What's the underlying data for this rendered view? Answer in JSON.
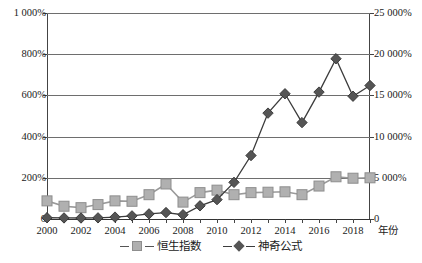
{
  "chart_data": {
    "type": "line",
    "title": "",
    "xlabel": "年份",
    "ylabel": "",
    "x": [
      2000,
      2001,
      2002,
      2003,
      2004,
      2005,
      2006,
      2007,
      2008,
      2009,
      2010,
      2011,
      2012,
      2013,
      2014,
      2015,
      2016,
      2017,
      2018,
      2019
    ],
    "categories": [
      "2000",
      "2001",
      "2002",
      "2003",
      "2004",
      "2005",
      "2006",
      "2007",
      "2008",
      "2009",
      "2010",
      "2011",
      "2012",
      "2013",
      "2014",
      "2015",
      "2016",
      "2017",
      "2018",
      "2019"
    ],
    "grid": true,
    "legend_position": "bottom",
    "axes": {
      "left": {
        "label": "",
        "ylim": [
          0,
          1000
        ],
        "unit": "%",
        "ticks": [
          0,
          200,
          400,
          600,
          800,
          1000
        ],
        "tick_labels": [
          "0",
          "200%",
          "400%",
          "600%",
          "800%",
          "1 000%"
        ]
      },
      "right": {
        "label": "",
        "ylim": [
          0,
          25000
        ],
        "unit": "%",
        "ticks": [
          0,
          5000,
          10000,
          15000,
          20000,
          25000
        ],
        "tick_labels": [
          "0",
          "5 000%",
          "10 000%",
          "15 000%",
          "20 000%",
          "25 000%"
        ]
      }
    },
    "x_tick_labels": [
      "2000",
      "2002",
      "2004",
      "2006",
      "2008",
      "2010",
      "2012",
      "2014",
      "2016",
      "2018"
    ],
    "series": [
      {
        "name": "恒生指数",
        "axis": "left",
        "marker": "square",
        "color": "#b0b0b0",
        "line_color": "#9a9a9a",
        "values": [
          88,
          62,
          55,
          70,
          88,
          86,
          118,
          170,
          82,
          128,
          140,
          118,
          128,
          130,
          132,
          118,
          160,
          205,
          198,
          200
        ]
      },
      {
        "name": "神奇公式",
        "axis": "right",
        "marker": "diamond",
        "color": "#555555",
        "line_color": "#3c3c3c",
        "values": [
          150,
          130,
          120,
          140,
          230,
          380,
          620,
          780,
          520,
          1600,
          2350,
          4450,
          7700,
          12850,
          15200,
          11700,
          15400,
          19450,
          14900,
          16200
        ]
      }
    ]
  },
  "legend": {
    "items": [
      {
        "label": "恒生指数",
        "marker": "square"
      },
      {
        "label": "神奇公式",
        "marker": "diamond"
      }
    ]
  }
}
